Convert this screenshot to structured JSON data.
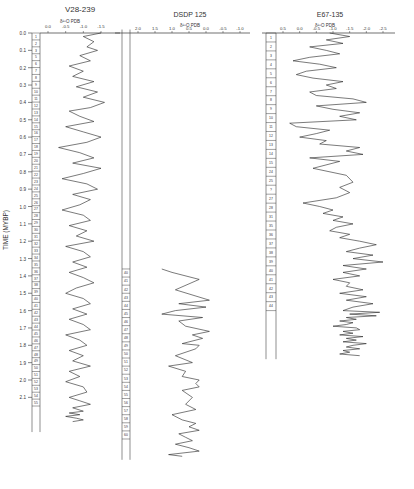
{
  "ylabel": "TIME (MYBP)",
  "time_ticks": [
    "0.0",
    "0.1",
    "0.2",
    "0.3",
    "0.4",
    "0.5",
    "0.6",
    "0.7",
    "0.8",
    "0.9",
    "1.0",
    "1.1",
    "1.2",
    "1.3",
    "1.4",
    "1.5",
    "1.6",
    "1.7",
    "1.8",
    "1.9",
    "2.0",
    "2.1"
  ],
  "panels": [
    {
      "title": "V28-239",
      "xlabel": "δ¹⁸O PDB",
      "xticks": [
        "0.0",
        "-0.5",
        "-1.0",
        "-1.5"
      ],
      "stages": [
        "1",
        "2",
        "3",
        "5",
        "6",
        "7",
        "8",
        "9",
        "10",
        "11",
        "12",
        "13",
        "14",
        "15",
        "16",
        "17",
        "18",
        "19",
        "20",
        "21",
        "22",
        "23",
        "24",
        "25",
        "26",
        "27",
        "28",
        "29",
        "30",
        "31",
        "32",
        "33",
        "34",
        "35",
        "36",
        "37",
        "38",
        "39",
        "40",
        "41",
        "42",
        "43",
        "44",
        "45",
        "46",
        "47",
        "48",
        "49",
        "50",
        "51",
        "52",
        "53",
        "54",
        "55"
      ]
    },
    {
      "title": "DSDP 125",
      "xlabel": "δ¹⁸O PDB",
      "xticks": [
        "2.0",
        "1.5",
        "1.0",
        "0.5",
        "0.0",
        "-0.5",
        "-1.0"
      ],
      "stages": [
        "40",
        "41",
        "42",
        "43",
        "44",
        "45",
        "46",
        "47",
        "48",
        "49",
        "50",
        "51",
        "52",
        "53",
        "54",
        "55",
        "56",
        "57",
        "58",
        "59",
        "60"
      ]
    },
    {
      "title": "E67-135",
      "xlabel": "δ¹⁸O PDB",
      "xticks": [
        "0.5",
        "0.0",
        "-0.5",
        "-1.0",
        "-1.5",
        "-2.0",
        "-2.5"
      ],
      "stages": [
        "1",
        "2",
        "3",
        "4",
        "5",
        "6",
        "7",
        "8",
        "9",
        "10",
        "11",
        "12",
        "13",
        "14",
        "15",
        "24",
        "25",
        "?",
        "27",
        "28",
        "31",
        "35",
        "36",
        "37",
        "38",
        "39",
        "40",
        "41",
        "42",
        "43",
        "44"
      ]
    }
  ],
  "chart_data": [
    {
      "type": "line",
      "title": "V28-239",
      "xlabel": "δ18O PDB (‰)",
      "ylabel": "TIME (MYBP)",
      "xlim": [
        0.3,
        -1.8
      ],
      "ylim": [
        0.0,
        2.2
      ],
      "series": [
        {
          "name": "V28-239 δ18O",
          "x": [
            -1.5,
            -1.0,
            -1.3,
            -1.1,
            -1.4,
            -0.9,
            -1.2,
            -0.6,
            -1.0,
            -0.7,
            -1.3,
            -0.8,
            -1.4,
            -1.0,
            -1.6,
            -1.2,
            -0.6,
            -0.9,
            -1.3,
            -0.5,
            -1.0,
            -1.5,
            -1.1,
            -0.3,
            -0.9,
            -1.3,
            -0.7,
            -1.5,
            -1.0,
            -0.4,
            -1.1,
            -1.4,
            -0.7,
            -1.2,
            -0.9,
            -0.4,
            -1.0,
            -1.2,
            -0.6,
            -1.1,
            -0.8,
            -1.3,
            -0.5,
            -1.0,
            -1.2,
            -0.7,
            -1.1,
            -0.6,
            -1.0,
            -1.3,
            -0.8,
            -0.5,
            -1.0,
            -1.2,
            -0.7,
            -1.1,
            -0.6,
            -1.0,
            -1.2,
            -0.5,
            -0.9,
            -1.1,
            -0.6,
            -1.0,
            -0.7,
            -1.2,
            -0.6,
            -0.9,
            -0.5,
            -1.0,
            -1.1,
            -0.6,
            -0.9,
            -1.2,
            -0.7,
            -1.0,
            -0.6,
            -0.9,
            -0.5,
            -0.8,
            -1.0,
            -0.7
          ],
          "y": [
            0.0,
            0.02,
            0.05,
            0.08,
            0.1,
            0.13,
            0.16,
            0.19,
            0.22,
            0.25,
            0.28,
            0.31,
            0.34,
            0.37,
            0.4,
            0.43,
            0.45,
            0.48,
            0.51,
            0.54,
            0.57,
            0.6,
            0.63,
            0.66,
            0.69,
            0.72,
            0.75,
            0.78,
            0.81,
            0.84,
            0.87,
            0.9,
            0.93,
            0.96,
            0.99,
            1.02,
            1.05,
            1.08,
            1.11,
            1.14,
            1.17,
            1.2,
            1.23,
            1.26,
            1.29,
            1.32,
            1.35,
            1.38,
            1.41,
            1.44,
            1.47,
            1.5,
            1.53,
            1.56,
            1.59,
            1.62,
            1.65,
            1.68,
            1.71,
            1.74,
            1.77,
            1.8,
            1.83,
            1.86,
            1.89,
            1.92,
            1.95,
            1.98,
            2.01,
            2.04,
            2.07,
            2.1,
            2.12,
            2.14,
            2.16,
            2.18,
            2.19,
            2.2,
            2.21,
            2.22,
            2.23,
            2.24
          ]
        }
      ]
    },
    {
      "type": "line",
      "title": "DSDP 125",
      "xlabel": "δ18O PDB (‰)",
      "ylabel": "TIME (MYBP)",
      "xlim": [
        2.3,
        -1.2
      ],
      "ylim": [
        1.35,
        2.35
      ],
      "series": [
        {
          "name": "DSDP 125 δ18O",
          "x": [
            1.3,
            1.0,
            0.2,
            0.9,
            -0.1,
            0.8,
            0.0,
            0.9,
            1.3,
            0.1,
            0.8,
            0.6,
            -0.1,
            0.4,
            0.1,
            0.7,
            0.2,
            0.3,
            0.9,
            0.4,
            1.1,
            0.6,
            0.7,
            0.2,
            0.3,
            0.2,
            0.7,
            0.4,
            0.6,
            0.3,
            1.0,
            0.7,
            0.3,
            0.5,
            0.2,
            0.8,
            0.6,
            0.4,
            0.9,
            0.5,
            0.2,
            1.1,
            0.7
          ],
          "y": [
            1.36,
            1.38,
            1.42,
            1.48,
            1.54,
            1.56,
            1.58,
            1.6,
            1.62,
            1.64,
            1.66,
            1.69,
            1.72,
            1.74,
            1.76,
            1.79,
            1.8,
            1.82,
            1.86,
            1.9,
            1.92,
            1.95,
            1.98,
            2.0,
            2.02,
            2.04,
            2.06,
            2.1,
            2.14,
            2.17,
            2.2,
            2.23,
            2.25,
            2.27,
            2.29,
            2.31,
            2.33,
            2.35,
            2.37,
            2.39,
            2.41,
            2.43,
            2.44
          ]
        }
      ]
    },
    {
      "type": "line",
      "title": "E67-135",
      "xlabel": "δ18O PDB (‰)",
      "ylabel": "TIME (MYBP)",
      "xlim": [
        0.8,
        -2.9
      ],
      "ylim": [
        0.0,
        1.62
      ],
      "series": [
        {
          "name": "E67-135 δ18O",
          "x": [
            -0.9,
            -1.5,
            -0.8,
            -1.3,
            -0.3,
            -0.8,
            -1.2,
            -0.3,
            0.2,
            -0.6,
            -1.1,
            -0.2,
            0.1,
            -0.4,
            -1.3,
            -0.8,
            -1.1,
            -0.3,
            -0.5,
            -1.6,
            -2.0,
            -0.5,
            -1.0,
            -1.8,
            -1.2,
            -1.7,
            0.3,
            0.1,
            -0.9,
            -0.5,
            0.0,
            -0.8,
            -0.6,
            -1.8,
            -1.4,
            -1.9,
            -0.3,
            -1.2,
            -0.4,
            -1.4,
            -1.6,
            -1.2,
            -1.5,
            -1.1,
            -0.1,
            -0.6,
            -1.0,
            -0.7,
            -1.3,
            -1.0,
            -1.6,
            -1.1,
            -0.9,
            -1.5,
            -1.2,
            -1.8,
            -2.3,
            -1.8,
            -1.4,
            -2.2,
            -1.6,
            -2.5,
            -1.3,
            -2.0,
            -1.3,
            -1.8,
            -1.0,
            -1.5,
            -1.4,
            -1.9,
            -1.2,
            -2.0,
            -1.4,
            -2.2,
            -1.6,
            -1.3,
            -2.4,
            -1.5,
            -2.3,
            -1.4,
            -1.7,
            -1.2,
            -1.6,
            -1.4,
            -1.0,
            -1.7,
            -1.8,
            -1.3,
            -1.6,
            -1.2,
            -1.9,
            -1.4,
            -1.7,
            -1.3,
            -2.0,
            -1.6,
            -1.4,
            -1.8,
            -1.3,
            -1.5,
            -1.2,
            -1.8
          ],
          "y": [
            0.0,
            0.02,
            0.04,
            0.06,
            0.08,
            0.1,
            0.12,
            0.14,
            0.16,
            0.18,
            0.2,
            0.22,
            0.24,
            0.26,
            0.28,
            0.3,
            0.32,
            0.34,
            0.36,
            0.38,
            0.4,
            0.42,
            0.44,
            0.46,
            0.48,
            0.5,
            0.52,
            0.54,
            0.56,
            0.58,
            0.6,
            0.62,
            0.64,
            0.66,
            0.68,
            0.7,
            0.72,
            0.74,
            0.78,
            0.82,
            0.86,
            0.89,
            0.92,
            0.95,
            0.98,
            1.0,
            1.02,
            1.04,
            1.06,
            1.08,
            1.1,
            1.12,
            1.14,
            1.16,
            1.18,
            1.2,
            1.22,
            1.24,
            1.26,
            1.28,
            1.3,
            1.32,
            1.34,
            1.36,
            1.38,
            1.4,
            1.42,
            1.44,
            1.46,
            1.48,
            1.5,
            1.52,
            1.54,
            1.56,
            1.58,
            1.6,
            1.61,
            1.62,
            1.63,
            1.64,
            1.65,
            1.66,
            1.67,
            1.68,
            1.69,
            1.7,
            1.71,
            1.72,
            1.73,
            1.74,
            1.75,
            1.76,
            1.77,
            1.78,
            1.79,
            1.8,
            1.81,
            1.82,
            1.83,
            1.84,
            1.85,
            1.86
          ]
        }
      ]
    }
  ]
}
